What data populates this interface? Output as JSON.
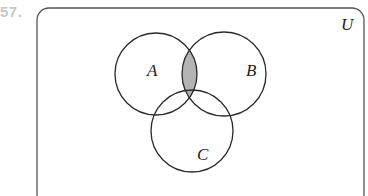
{
  "problem": {
    "number": "57."
  },
  "diagram": {
    "type": "venn",
    "universe_label": "U",
    "sets": [
      {
        "name": "A",
        "label": "A"
      },
      {
        "name": "B",
        "label": "B"
      },
      {
        "name": "C",
        "label": "C"
      }
    ],
    "shaded_region": "A ∩ B",
    "colors": {
      "outline": "#2a2a2a",
      "shade": "#b4b4b4",
      "frame": "#555555"
    }
  }
}
